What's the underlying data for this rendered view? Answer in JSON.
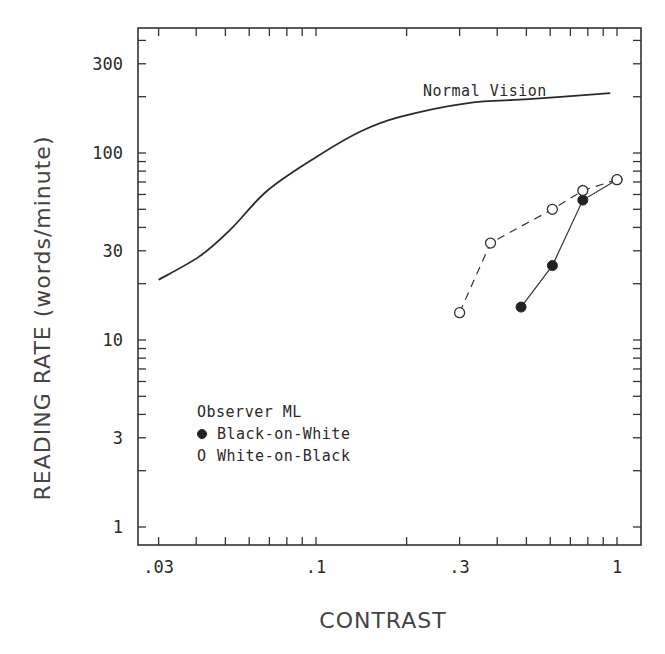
{
  "chart_data": {
    "type": "line",
    "title": "",
    "xlabel": "CONTRAST",
    "ylabel": "READING RATE  (words/minute)",
    "xscale": "log",
    "yscale": "log",
    "xlim": [
      0.025,
      1.2
    ],
    "ylim": [
      0.8,
      500
    ],
    "xticks": [
      {
        "value": 0.03,
        "label": ".03"
      },
      {
        "value": 0.1,
        "label": ".1"
      },
      {
        "value": 0.3,
        "label": ".3"
      },
      {
        "value": 1,
        "label": "1"
      }
    ],
    "yticks": [
      {
        "value": 1,
        "label": "1"
      },
      {
        "value": 3,
        "label": "3"
      },
      {
        "value": 10,
        "label": "10"
      },
      {
        "value": 30,
        "label": "30"
      },
      {
        "value": 100,
        "label": "100"
      },
      {
        "value": 300,
        "label": "300"
      }
    ],
    "grid": false,
    "legend_position": "lower-left inside",
    "legend": {
      "title": "Observer ML",
      "entries": [
        {
          "marker": "filled-circle",
          "symbol": "●",
          "label": "Black-on-White"
        },
        {
          "marker": "open-circle",
          "symbol": "O",
          "label": "White-on-Black"
        }
      ]
    },
    "series": [
      {
        "name": "Normal Vision",
        "style": "solid-curve",
        "annotation": "Normal Vision",
        "x": [
          0.03,
          0.041,
          0.052,
          0.069,
          0.1,
          0.14,
          0.19,
          0.32,
          0.51,
          0.95
        ],
        "y": [
          21,
          28,
          39,
          63,
          95,
          130,
          156,
          185,
          194,
          209
        ]
      },
      {
        "name": "Black-on-White",
        "style": "solid-line-filled-circles",
        "x": [
          0.48,
          0.61,
          0.77,
          1.0
        ],
        "y": [
          15,
          25,
          56,
          72
        ]
      },
      {
        "name": "White-on-Black",
        "style": "dashed-line-open-circles",
        "x": [
          0.3,
          0.38,
          0.61,
          0.77,
          1.0
        ],
        "y": [
          14,
          33,
          50,
          63,
          72
        ]
      }
    ]
  }
}
